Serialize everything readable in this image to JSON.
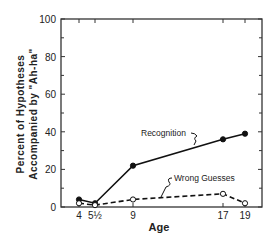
{
  "chart_data": {
    "type": "line",
    "title": "",
    "xlabel": "Age",
    "ylabel_line1": "Percent of Hypotheses",
    "ylabel_line2": "Accompanied by \"Ah-ha\"",
    "x": [
      4,
      5.5,
      9,
      17,
      19
    ],
    "x_tick_labels": [
      "4",
      "5½",
      "9",
      "17",
      "19"
    ],
    "y_ticks": [
      0,
      20,
      40,
      60,
      80,
      100
    ],
    "ylim": [
      0,
      100
    ],
    "grid": false,
    "series": [
      {
        "name": "Recognition",
        "style": "solid",
        "marker": "filled-circle",
        "values": [
          4,
          2,
          22,
          36,
          39
        ]
      },
      {
        "name": "Wrong Guesses",
        "style": "dashed",
        "marker": "open-circle",
        "values": [
          2,
          1,
          4,
          7,
          2
        ]
      }
    ],
    "annotations": [
      {
        "text": "Recognition",
        "series": "Recognition"
      },
      {
        "text": "Wrong  Guesses",
        "series": "Wrong Guesses"
      }
    ]
  }
}
